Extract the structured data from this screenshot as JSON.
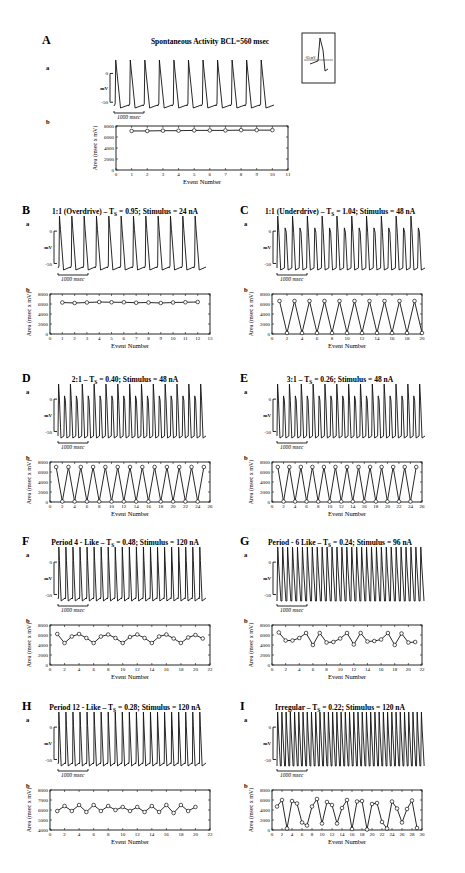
{
  "figure": {
    "panels": [
      {
        "id": "A",
        "letter": "A",
        "title": "Spontaneous Activity  BCL=560 msec",
        "trace": {
          "sublabel": "a",
          "ytop": "0",
          "ybot": "-50",
          "yunit": "mV",
          "scalebar": "1000 msec",
          "beats": 11,
          "style": "spontaneous"
        },
        "inset": {
          "label": "-65 mV"
        },
        "plot": {
          "sublabel": "b"
        }
      },
      {
        "id": "B",
        "letter": "B",
        "title": "1:1 (Overdrive) – T",
        "title_sub": "S",
        "title_rest": " = 0.95; Stimulus = 24 nA",
        "trace": {
          "sublabel": "a",
          "ytop": "0",
          "ybot": "-50",
          "yunit": "mV",
          "scalebar": "1000 msec",
          "beats": 12,
          "style": "regular"
        },
        "plot": {
          "sublabel": "b"
        }
      },
      {
        "id": "C",
        "letter": "C",
        "title": "1:1 (Underdrive) – T",
        "title_sub": "S",
        "title_rest": " = 1.04; Stimulus = 48 nA",
        "trace": {
          "sublabel": "a",
          "ytop": "0",
          "ybot": "-50",
          "yunit": "mV",
          "scalebar": "1000 msec",
          "beats": 20,
          "style": "alternating"
        },
        "plot": {
          "sublabel": "b"
        }
      },
      {
        "id": "D",
        "letter": "D",
        "title": "2:1 – T",
        "title_sub": "S",
        "title_rest": " = 0.40; Stimulus = 48 nA",
        "trace": {
          "sublabel": "a",
          "ytop": "0",
          "ybot": "-50",
          "yunit": "mV",
          "scalebar": "1000 msec",
          "beats": 25,
          "style": "alternating"
        },
        "plot": {
          "sublabel": "b"
        }
      },
      {
        "id": "E",
        "letter": "E",
        "title": "3:1 – T",
        "title_sub": "S",
        "title_rest": " = 0.26; Stimulus = 48 nA",
        "trace": {
          "sublabel": "a",
          "ytop": "0",
          "ybot": "-50",
          "yunit": "mV",
          "scalebar": "1000 msec",
          "beats": 25,
          "style": "alternating"
        },
        "plot": {
          "sublabel": "b"
        }
      },
      {
        "id": "F",
        "letter": "F",
        "title": "Period 4 - Like – T",
        "title_sub": "S",
        "title_rest": " = 0.48; Stimulus = 120 nA",
        "trace": {
          "sublabel": "a",
          "ytop": "0",
          "ybot": "-50",
          "yunit": "mV",
          "scalebar": "1000 msec",
          "beats": 21,
          "style": "regular"
        },
        "plot": {
          "sublabel": "b"
        }
      },
      {
        "id": "G",
        "letter": "G",
        "title": "Period - 6 Like – T",
        "title_sub": "S",
        "title_rest": " = 0.24; Stimulus = 96 nA",
        "trace": {
          "sublabel": "a",
          "ytop": "0",
          "ybot": "-50",
          "yunit": "mV",
          "scalebar": "1000 msec",
          "beats": 30,
          "style": "dense"
        },
        "plot": {
          "sublabel": "b"
        }
      },
      {
        "id": "H",
        "letter": "H",
        "title": "Period 12 - Like – T",
        "title_sub": "S",
        "title_rest": " = 0.28; Stimulus = 120 nA",
        "trace": {
          "sublabel": "a",
          "ytop": "0",
          "ybot": "-50",
          "yunit": "mV",
          "scalebar": "1000 msec",
          "beats": 21,
          "style": "regular"
        },
        "plot": {
          "sublabel": "b"
        }
      },
      {
        "id": "I",
        "letter": "I",
        "title": "Irregular – T",
        "title_sub": "S",
        "title_rest": " = 0.22; Stimulus = 120 nA",
        "trace": {
          "sublabel": "a",
          "ytop": "0",
          "ybot": "-50",
          "yunit": "mV",
          "scalebar": "1000 msec",
          "beats": 35,
          "style": "dense"
        },
        "plot": {
          "sublabel": "b"
        }
      }
    ]
  },
  "chart_data": [
    {
      "panel": "A",
      "type": "line",
      "title": "Spontaneous Activity  BCL=560 msec",
      "xlabel": "Event Number",
      "ylabel": "Area (msec x mV)",
      "xlim": [
        0,
        11
      ],
      "ylim": [
        0,
        8000
      ],
      "xticks": [
        0,
        1,
        2,
        3,
        4,
        5,
        6,
        7,
        8,
        9,
        10,
        11
      ],
      "yticks": [
        2000,
        4000,
        6000,
        8000
      ],
      "x": [
        1,
        2,
        3,
        4,
        5,
        6,
        7,
        8,
        9,
        10
      ],
      "values": [
        7100,
        7100,
        7150,
        7150,
        7200,
        7200,
        7200,
        7250,
        7250,
        7250
      ]
    },
    {
      "panel": "B",
      "type": "line",
      "title": "1:1 (Overdrive) – TS = 0.95; Stimulus = 24 nA",
      "xlabel": "Event Number",
      "ylabel": "Area (msec x mV)",
      "xlim": [
        0,
        13
      ],
      "ylim": [
        0,
        8000
      ],
      "xticks": [
        0,
        1,
        2,
        3,
        4,
        5,
        6,
        7,
        8,
        9,
        10,
        11,
        12,
        13
      ],
      "yticks": [
        2000,
        4000,
        6000,
        8000
      ],
      "x": [
        1,
        2,
        3,
        4,
        5,
        6,
        7,
        8,
        9,
        10,
        11,
        12
      ],
      "values": [
        6300,
        6200,
        6300,
        6400,
        6350,
        6350,
        6250,
        6300,
        6200,
        6300,
        6350,
        6400
      ]
    },
    {
      "panel": "C",
      "type": "line",
      "title": "1:1 (Underdrive) – TS = 1.04; Stimulus = 48 nA",
      "xlabel": "Event Number",
      "ylabel": "Area (msec x mV)",
      "xlim": [
        0,
        20
      ],
      "ylim": [
        0,
        8000
      ],
      "xticks": [
        0,
        2,
        4,
        6,
        8,
        10,
        12,
        14,
        16,
        18,
        20
      ],
      "yticks": [
        2000,
        4000,
        6000,
        8000
      ],
      "x": [
        1,
        2,
        3,
        4,
        5,
        6,
        7,
        8,
        9,
        10,
        11,
        12,
        13,
        14,
        15,
        16,
        17,
        18,
        19,
        20
      ],
      "values": [
        6600,
        200,
        6600,
        200,
        6600,
        200,
        6600,
        200,
        6600,
        200,
        6600,
        200,
        6600,
        200,
        6600,
        200,
        6600,
        200,
        6600,
        200
      ]
    },
    {
      "panel": "D",
      "type": "line",
      "title": "2:1 – TS = 0.40; Stimulus = 48 nA",
      "xlabel": "Event Number",
      "ylabel": "Area (msec x mV)",
      "xlim": [
        0,
        26
      ],
      "ylim": [
        0,
        8000
      ],
      "xticks": [
        0,
        2,
        4,
        6,
        8,
        10,
        12,
        14,
        16,
        18,
        20,
        22,
        24,
        26
      ],
      "yticks": [
        2000,
        4000,
        6000,
        8000
      ],
      "x": [
        1,
        2,
        3,
        4,
        5,
        6,
        7,
        8,
        9,
        10,
        11,
        12,
        13,
        14,
        15,
        16,
        17,
        18,
        19,
        20,
        21,
        22,
        23,
        24,
        25
      ],
      "values": [
        7000,
        100,
        7000,
        100,
        7000,
        100,
        7000,
        100,
        7000,
        100,
        7000,
        100,
        7000,
        100,
        7000,
        100,
        7000,
        100,
        7000,
        100,
        7000,
        100,
        7000,
        100,
        7000
      ]
    },
    {
      "panel": "E",
      "type": "line",
      "title": "3:1 – TS = 0.26; Stimulus = 48 nA",
      "xlabel": "Event Number",
      "ylabel": "Area (msec x mV)",
      "xlim": [
        0,
        26
      ],
      "ylim": [
        0,
        8000
      ],
      "xticks": [
        0,
        2,
        4,
        6,
        8,
        10,
        12,
        14,
        16,
        18,
        20,
        22,
        24,
        26
      ],
      "yticks": [
        2000,
        4000,
        6000,
        8000
      ],
      "x": [
        1,
        2,
        3,
        4,
        5,
        6,
        7,
        8,
        9,
        10,
        11,
        12,
        13,
        14,
        15,
        16,
        17,
        18,
        19,
        20,
        21,
        22,
        23,
        24,
        25
      ],
      "values": [
        7000,
        100,
        7000,
        100,
        7000,
        100,
        7000,
        100,
        7000,
        100,
        7000,
        100,
        7000,
        100,
        7000,
        100,
        7000,
        100,
        7000,
        100,
        7000,
        100,
        7000,
        100,
        7000
      ]
    },
    {
      "panel": "F",
      "type": "line",
      "title": "Period 4 - Like – TS = 0.48; Stimulus = 120 nA",
      "xlabel": "Event Number",
      "ylabel": "Area (msec x mV)",
      "xlim": [
        0,
        22
      ],
      "ylim": [
        0,
        8000
      ],
      "xticks": [
        0,
        2,
        4,
        6,
        8,
        10,
        12,
        14,
        16,
        18,
        20,
        22
      ],
      "yticks": [
        2000,
        4000,
        6000,
        8000
      ],
      "x": [
        1,
        2,
        3,
        4,
        5,
        6,
        7,
        8,
        9,
        10,
        11,
        12,
        13,
        14,
        15,
        16,
        17,
        18,
        19,
        20,
        21
      ],
      "values": [
        6200,
        4400,
        5700,
        6200,
        5400,
        4400,
        5700,
        6100,
        5400,
        4400,
        5600,
        6100,
        5400,
        4400,
        5700,
        6100,
        5300,
        4400,
        5500,
        6000,
        5300
      ]
    },
    {
      "panel": "G",
      "type": "line",
      "title": "Period - 6 Like – TS = 0.24; Stimulus = 96 nA",
      "xlabel": "Event Number",
      "ylabel": "Area (msec x mV)",
      "xlim": [
        0,
        22
      ],
      "ylim": [
        0,
        8000
      ],
      "xticks": [
        0,
        2,
        4,
        6,
        8,
        10,
        12,
        14,
        16,
        18,
        20,
        22
      ],
      "yticks": [
        2000,
        4000,
        6000,
        8000
      ],
      "x": [
        1,
        2,
        3,
        4,
        5,
        6,
        7,
        8,
        9,
        10,
        11,
        12,
        13,
        14,
        15,
        16,
        17,
        18,
        19,
        20,
        21
      ],
      "values": [
        6500,
        4900,
        4900,
        5400,
        6400,
        4000,
        6400,
        4500,
        4600,
        5300,
        6400,
        4100,
        6400,
        4700,
        4800,
        5100,
        6400,
        4000,
        6300,
        4500,
        4600
      ]
    },
    {
      "panel": "H",
      "type": "line",
      "title": "Period 12 - Like – TS = 0.28; Stimulus = 120 nA",
      "xlabel": "Event Number",
      "ylabel": "Area (msec x mV)",
      "xlim": [
        0,
        22
      ],
      "ylim": [
        4000,
        8000
      ],
      "xticks": [
        0,
        2,
        4,
        6,
        8,
        10,
        12,
        14,
        16,
        18,
        20,
        22
      ],
      "yticks": [
        4000,
        5000,
        6000,
        7000,
        8000
      ],
      "x": [
        1,
        2,
        3,
        4,
        5,
        6,
        7,
        8,
        9,
        10,
        11,
        12,
        13,
        14,
        15,
        16,
        17,
        18,
        19,
        20
      ],
      "values": [
        5900,
        6400,
        5900,
        6500,
        5800,
        6500,
        5900,
        6400,
        6000,
        6300,
        5900,
        6300,
        5800,
        6400,
        5800,
        6500,
        5700,
        6500,
        5900,
        6300
      ]
    },
    {
      "panel": "I",
      "type": "line",
      "title": "Irregular – TS = 0.22; Stimulus = 120 nA",
      "xlabel": "Event Number",
      "ylabel": "Area (msec x mV)",
      "xlim": [
        0,
        30
      ],
      "ylim": [
        0,
        8000
      ],
      "xticks": [
        0,
        2,
        4,
        6,
        8,
        10,
        12,
        14,
        16,
        18,
        20,
        22,
        24,
        26,
        28,
        30
      ],
      "yticks": [
        2000,
        4000,
        6000,
        8000
      ],
      "x": [
        1,
        2,
        3,
        4,
        5,
        6,
        7,
        8,
        9,
        10,
        11,
        12,
        13,
        14,
        15,
        16,
        17,
        18,
        19,
        20,
        21,
        22,
        23,
        24,
        25,
        26,
        27,
        28,
        29
      ],
      "values": [
        4700,
        6000,
        300,
        5800,
        5300,
        1500,
        900,
        4700,
        6200,
        1300,
        5600,
        5000,
        1300,
        4400,
        6000,
        200,
        5700,
        5800,
        100,
        5200,
        5400,
        1600,
        300,
        5700,
        4300,
        1500,
        4200,
        5900,
        400
      ]
    }
  ]
}
